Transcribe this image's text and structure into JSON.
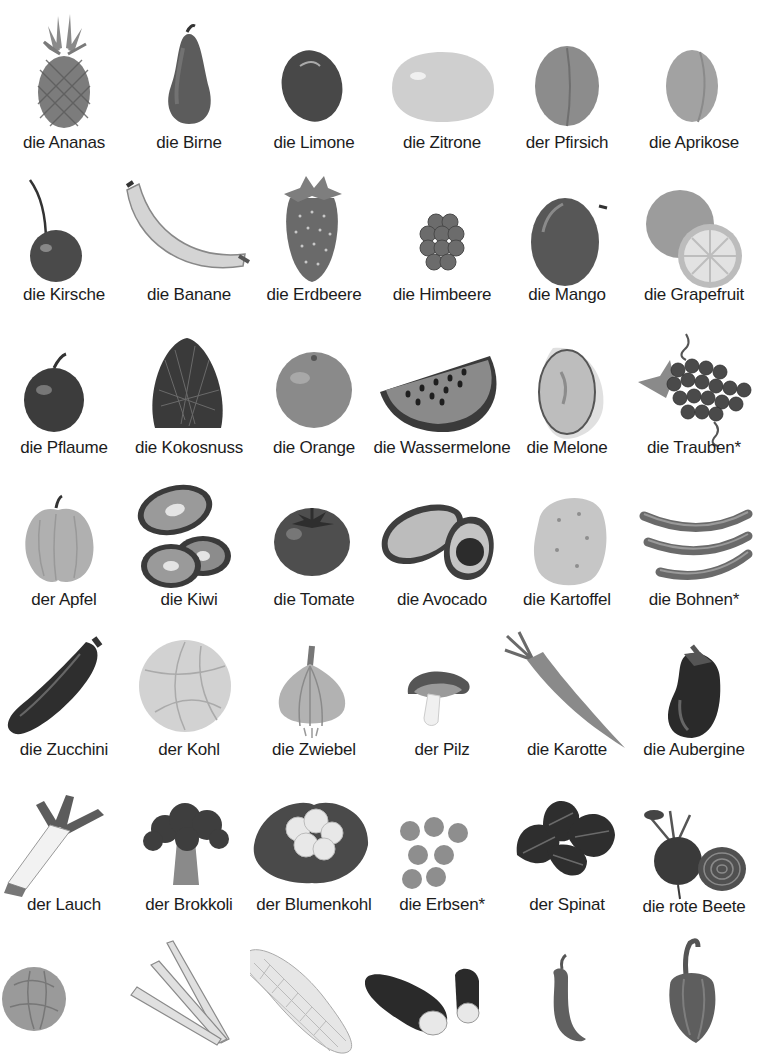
{
  "rows": [
    {
      "items": [
        {
          "label": "die Ananas",
          "icon": "pineapple-icon"
        },
        {
          "label": "die Birne",
          "icon": "pear-icon"
        },
        {
          "label": "die Limone",
          "icon": "lime-icon"
        },
        {
          "label": "die Zitrone",
          "icon": "lemon-icon"
        },
        {
          "label": "der Pfirsich",
          "icon": "peach-icon"
        },
        {
          "label": "die Aprikose",
          "icon": "apricot-icon"
        }
      ]
    },
    {
      "items": [
        {
          "label": "die Kirsche",
          "icon": "cherry-icon"
        },
        {
          "label": "die Banane",
          "icon": "banana-icon"
        },
        {
          "label": "die Erdbeere",
          "icon": "strawberry-icon"
        },
        {
          "label": "die Himbeere",
          "icon": "raspberry-icon"
        },
        {
          "label": "die Mango",
          "icon": "mango-icon"
        },
        {
          "label": "die Grapefruit",
          "icon": "grapefruit-icon"
        }
      ]
    },
    {
      "items": [
        {
          "label": "die Pflaume",
          "icon": "plum-icon"
        },
        {
          "label": "die Kokosnuss",
          "icon": "coconut-icon"
        },
        {
          "label": "die Orange",
          "icon": "orange-icon"
        },
        {
          "label": "die Wassermelone",
          "icon": "watermelon-icon"
        },
        {
          "label": "die Melone",
          "icon": "melon-icon"
        },
        {
          "label": "die Trauben*",
          "icon": "grapes-icon"
        }
      ]
    },
    {
      "items": [
        {
          "label": "der Apfel",
          "icon": "apple-icon"
        },
        {
          "label": "die Kiwi",
          "icon": "kiwi-icon"
        },
        {
          "label": "die Tomate",
          "icon": "tomato-icon"
        },
        {
          "label": "die Avocado",
          "icon": "avocado-icon"
        },
        {
          "label": "die Kartoffel",
          "icon": "potato-icon"
        },
        {
          "label": "die Bohnen*",
          "icon": "beans-icon"
        }
      ]
    },
    {
      "items": [
        {
          "label": "die Zucchini",
          "icon": "zucchini-icon"
        },
        {
          "label": "der Kohl",
          "icon": "cabbage-icon"
        },
        {
          "label": "die Zwiebel",
          "icon": "onion-icon"
        },
        {
          "label": "der Pilz",
          "icon": "mushroom-icon"
        },
        {
          "label": "die Karotte",
          "icon": "carrot-icon"
        },
        {
          "label": "die Aubergine",
          "icon": "eggplant-icon"
        }
      ]
    },
    {
      "items": [
        {
          "label": "der Lauch",
          "icon": "leek-icon"
        },
        {
          "label": "der Brokkoli",
          "icon": "broccoli-icon"
        },
        {
          "label": "der Blumenkohl",
          "icon": "cauliflower-icon"
        },
        {
          "label": "die Erbsen*",
          "icon": "peas-icon"
        },
        {
          "label": "der Spinat",
          "icon": "spinach-icon"
        },
        {
          "label": "die rote Beete",
          "icon": "beetroot-icon"
        }
      ]
    },
    {
      "items": [
        {
          "label": "",
          "icon": "lettuce-icon"
        },
        {
          "label": "",
          "icon": "celery-icon"
        },
        {
          "label": "",
          "icon": "corn-icon"
        },
        {
          "label": "",
          "icon": "cucumber-icon"
        },
        {
          "label": "",
          "icon": "chili-pepper-icon"
        },
        {
          "label": "",
          "icon": "bell-pepper-icon"
        }
      ]
    }
  ]
}
